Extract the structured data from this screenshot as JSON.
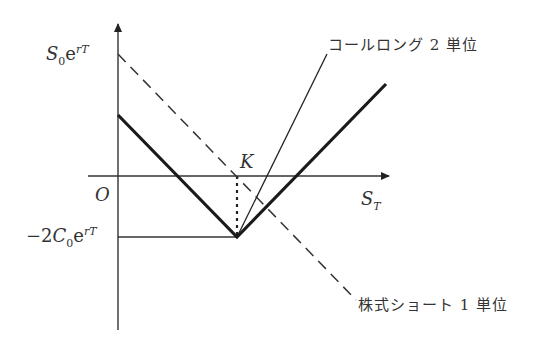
{
  "diagram": {
    "type": "payoff-diagram",
    "axes": {
      "x_label_main": "S",
      "x_label_sub": "T",
      "origin_label": "O"
    },
    "y_labels": {
      "top": {
        "main": "S",
        "sub": "0",
        "e": "e",
        "sup": "rT"
      },
      "bottom": {
        "prefix": "−2",
        "main": "C",
        "sub": "0",
        "e": "e",
        "sup": "rT"
      }
    },
    "strike_label": "K",
    "annotations": {
      "call_long": "コールロング 2 単位",
      "stock_short": "株式ショート 1 単位"
    },
    "colors": {
      "line": "#222222",
      "text": "#333333"
    }
  }
}
